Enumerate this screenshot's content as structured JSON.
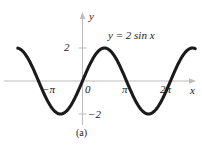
{
  "figure": {
    "caption": "(a)",
    "equation": "y = 2 sin x",
    "axis_labels": {
      "x": "x",
      "y": "y"
    },
    "colors": {
      "curve": "#1a1a1a",
      "axis": "#b5b5b5",
      "background": "#ffffff",
      "text": "#1a1a1a"
    }
  },
  "chart_data": {
    "type": "line",
    "title": "y = 2 sin x",
    "xlabel": "x",
    "ylabel": "y",
    "xlim": [
      -4.6,
      8.0
    ],
    "ylim": [
      -2.6,
      2.6
    ],
    "grid": false,
    "legend": null,
    "annotations": [
      {
        "text": "y = 2 sin x",
        "x": 3.0,
        "y": 2.55
      },
      {
        "text": "(a)",
        "x": 0.1,
        "y": -3.3
      }
    ],
    "xticks": [
      -3.14159,
      0,
      3.14159,
      6.28319
    ],
    "xtick_labels": [
      "−π",
      "0",
      "π",
      "2π"
    ],
    "yticks": [
      2,
      -2
    ],
    "ytick_labels": [
      "2",
      "−2"
    ],
    "series": [
      {
        "name": "y = 2 sin x",
        "amplitude": 2,
        "period": 6.28319,
        "x": [
          -4.6,
          -4.2,
          -3.8,
          -3.4,
          -3.14,
          -2.8,
          -2.4,
          -2.0,
          -1.6,
          -1.2,
          -0.8,
          -0.4,
          0.0,
          0.4,
          0.8,
          1.2,
          1.57,
          2.0,
          2.4,
          2.8,
          3.14,
          3.6,
          4.0,
          4.4,
          4.71,
          5.2,
          5.6,
          6.0,
          6.28,
          6.8,
          7.2,
          7.6,
          8.0
        ],
        "y": [
          1.98,
          1.74,
          1.24,
          0.51,
          0.0,
          -0.67,
          -1.35,
          -1.82,
          -2.0,
          -1.86,
          -1.43,
          -0.78,
          0.0,
          0.78,
          1.43,
          1.86,
          2.0,
          1.82,
          1.35,
          0.67,
          0.0,
          -0.88,
          -1.51,
          -1.91,
          -2.0,
          -1.74,
          -1.26,
          -0.56,
          0.0,
          1.04,
          1.064,
          1.95,
          1.98
        ]
      }
    ]
  }
}
